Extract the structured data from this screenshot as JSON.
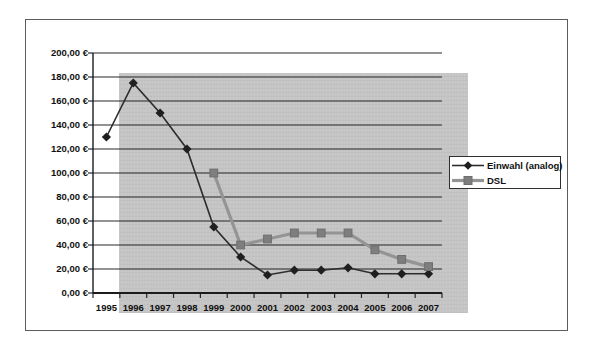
{
  "chart_data": {
    "type": "line",
    "title": "",
    "xlabel": "",
    "ylabel": "",
    "categories": [
      "1995",
      "1996",
      "1997",
      "1998",
      "1999",
      "2000",
      "2001",
      "2002",
      "2003",
      "2004",
      "2005",
      "2006",
      "2007"
    ],
    "series": [
      {
        "name": "Einwahl (analog)",
        "marker": "diamond",
        "line_color": "#2d2d2d",
        "marker_color": "#1f1f1f",
        "line_width": 1.6,
        "values": [
          130,
          175,
          150,
          120,
          55,
          30,
          15,
          19,
          19,
          21,
          16,
          16,
          16
        ]
      },
      {
        "name": "DSL",
        "marker": "square",
        "line_color": "#949494",
        "marker_color": "#7e7e7e",
        "line_width": 3.2,
        "values": [
          null,
          null,
          null,
          null,
          100,
          40,
          45,
          50,
          50,
          50,
          36,
          28,
          22
        ]
      }
    ],
    "ylim": [
      0,
      200
    ],
    "y_tick_step": 20,
    "y_tick_labels": [
      "0,00 €",
      "20,00 €",
      "40,00 €",
      "60,00 €",
      "80,00 €",
      "100,00 €",
      "120,00 €",
      "140,00 €",
      "160,00 €",
      "180,00 €",
      "200,00 €"
    ],
    "grid": true,
    "legend_position": "right",
    "plot_background": "#c5c5c5",
    "gridline_color": "#262626"
  }
}
